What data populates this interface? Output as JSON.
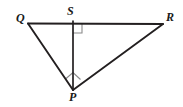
{
  "figure": {
    "type": "geometry-diagram",
    "background_color": "#ffffff",
    "stroke_color": "#231f20",
    "mark_color": "#808080",
    "vertices": [
      {
        "name": "Q",
        "label": "Q",
        "x": 28,
        "y": 23,
        "label_x": 16,
        "label_y": 12
      },
      {
        "name": "S",
        "label": "S",
        "x": 73,
        "y": 24,
        "label_x": 67,
        "label_y": 5
      },
      {
        "name": "R",
        "label": "R",
        "x": 163,
        "y": 24,
        "label_x": 166,
        "label_y": 11
      },
      {
        "name": "P",
        "label": "P",
        "x": 73,
        "y": 90,
        "label_x": 69,
        "label_y": 91
      }
    ],
    "segments": [
      {
        "name": "QR",
        "from": "Q",
        "to": "R",
        "x1": 28,
        "y1": 23,
        "x2": 163,
        "y2": 24
      },
      {
        "name": "QP",
        "from": "Q",
        "to": "P",
        "x1": 28,
        "y1": 23,
        "x2": 73,
        "y2": 90
      },
      {
        "name": "RP",
        "from": "R",
        "to": "P",
        "x1": 163,
        "y1": 24,
        "x2": 73,
        "y2": 90
      },
      {
        "name": "SP",
        "from": "S",
        "to": "P",
        "x1": 73,
        "y1": 24,
        "x2": 73,
        "y2": 90
      }
    ],
    "right_angle_marks": [
      {
        "name": "right-angle-at-S",
        "at_vertex": "S",
        "between": [
          "SR",
          "SP"
        ],
        "points": "73,33 82,33 82,24",
        "size": 9
      },
      {
        "name": "right-angle-at-P",
        "at_vertex": "P",
        "between": [
          "PQ",
          "PR"
        ],
        "points": "66,79 73,73 80,80",
        "size": 10
      }
    ]
  }
}
